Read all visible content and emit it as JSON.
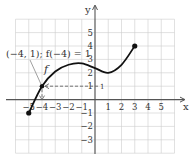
{
  "chart_data": {
    "type": "line",
    "title": "",
    "xlabel": "x",
    "ylabel": "y",
    "xlim": [
      -6,
      6
    ],
    "ylim": [
      -4,
      6
    ],
    "grid": true,
    "x_ticks": [
      "-5",
      "-4",
      "-3",
      "-2",
      "-1",
      "1",
      "2",
      "3",
      "4",
      "5"
    ],
    "y_ticks": [
      "5",
      "4",
      "3",
      "2",
      "1",
      "-1",
      "-2",
      "-3"
    ],
    "series": [
      {
        "name": "f",
        "points": [
          [
            -5,
            -1
          ],
          [
            -4,
            1
          ],
          [
            -3,
            2.1
          ],
          [
            -2,
            2.6
          ],
          [
            -1,
            2.7
          ],
          [
            0,
            2.35
          ],
          [
            1,
            2
          ],
          [
            2,
            2.6
          ],
          [
            3,
            4
          ]
        ],
        "endpoints": [
          [
            -5,
            -1
          ],
          [
            3,
            4
          ]
        ],
        "endpoints_closed": true
      }
    ],
    "annotations": [
      {
        "text": "(−4, 1); f(−4) = 1",
        "point": [
          -4,
          1
        ]
      },
      {
        "text": "f",
        "label_for": "curve"
      }
    ],
    "highlight_point": [
      -4,
      1
    ],
    "dashed_guides": {
      "horizontal_to_y": 1,
      "vertical_to_x": -4
    }
  },
  "labels": {
    "x_axis": "x",
    "y_axis": "y",
    "function_name": "f",
    "annotation": "(−4, 1); f(−4) = 1"
  },
  "colors": {
    "curve": "#111111",
    "grid": "#cccccc",
    "axis": "#555555",
    "dashed": "#666666"
  }
}
